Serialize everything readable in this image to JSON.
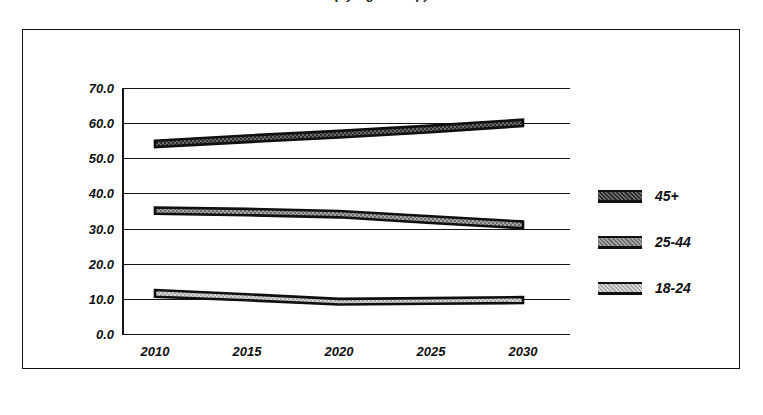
{
  "title": {
    "text": "(by Age Group)",
    "note": "clipped-at-top"
  },
  "chart_data": {
    "type": "area",
    "title": "(by Age Group)",
    "xlabel": "",
    "ylabel": "",
    "x": [
      2010,
      2015,
      2020,
      2025,
      2030
    ],
    "xtick_labels": [
      "2010",
      "2015",
      "2020",
      "2025",
      "2030"
    ],
    "ytick_labels": [
      "70.0",
      "60.0",
      "50.0",
      "40.0",
      "30.0",
      "20.0",
      "10.0",
      "0.0"
    ],
    "ylim": [
      0,
      70
    ],
    "ytick_step": 10,
    "grid": true,
    "legend_position": "right",
    "series": [
      {
        "name": "45+",
        "fill": "#5a5a5a",
        "upper": [
          55.0,
          56.5,
          57.8,
          59.3,
          61.0
        ],
        "lower": [
          53.2,
          54.6,
          55.9,
          57.4,
          59.2
        ]
      },
      {
        "name": "25-44",
        "fill": "#8f8f8f",
        "upper": [
          36.0,
          35.6,
          35.0,
          33.5,
          32.0
        ],
        "lower": [
          34.2,
          33.8,
          33.2,
          31.6,
          30.1
        ]
      },
      {
        "name": "18-24",
        "fill": "#c4c4c4",
        "upper": [
          12.5,
          11.3,
          10.0,
          10.2,
          10.5
        ],
        "lower": [
          10.6,
          9.6,
          8.4,
          8.6,
          8.8
        ]
      }
    ]
  },
  "legend": {
    "items": [
      {
        "label": "45+",
        "fill": "#5a5a5a"
      },
      {
        "label": "25-44",
        "fill": "#8f8f8f"
      },
      {
        "label": "18-24",
        "fill": "#c4c4c4"
      }
    ]
  },
  "colors": {
    "ink": "#121212",
    "background": "#ffffff"
  }
}
